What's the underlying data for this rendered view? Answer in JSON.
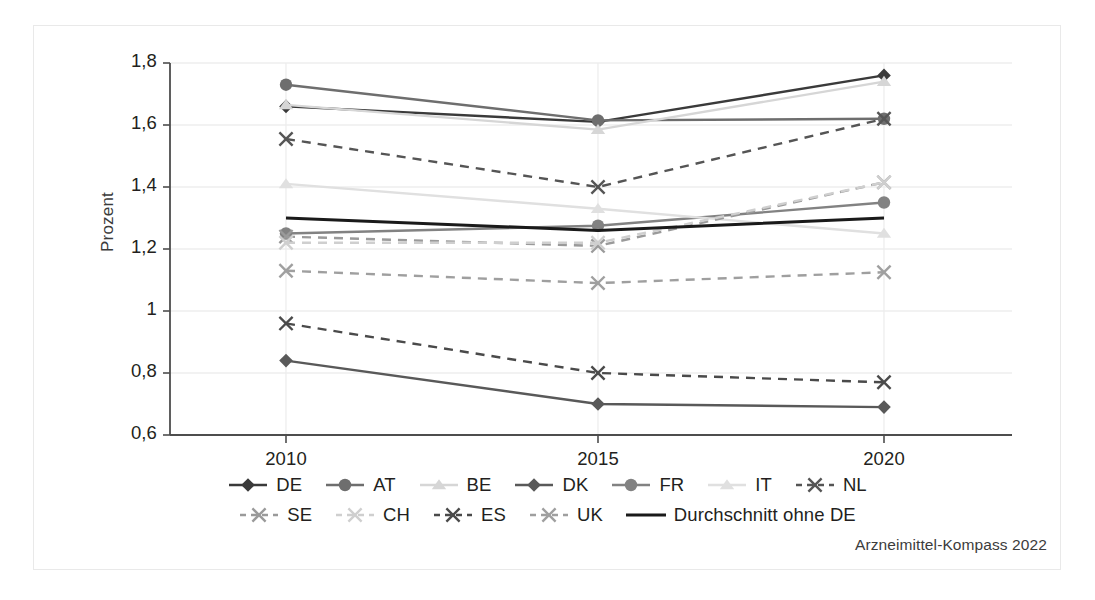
{
  "figure": {
    "source_note": "Arzneimittel-Kompass 2022"
  },
  "chart_data": {
    "type": "line",
    "title": "",
    "subtitle": "",
    "xlabel": "",
    "ylabel": "Prozent",
    "x": [
      2010,
      2015,
      2020
    ],
    "categories": [
      "2010",
      "2015",
      "2020"
    ],
    "xtick_labels": [
      "2010",
      "2015",
      "2020"
    ],
    "ytick_labels": [
      "0,6",
      "0,8",
      "1",
      "1,2",
      "1,4",
      "1,6",
      "1,8"
    ],
    "ytick_values": [
      0.6,
      0.8,
      1.0,
      1.2,
      1.4,
      1.6,
      1.8
    ],
    "ylim": [
      0.6,
      1.8
    ],
    "xlim": [
      2008.2,
      2021.8
    ],
    "grid": "horizontal-and-vertical-light",
    "legend_position": "bottom",
    "series": [
      {
        "name": "DE",
        "values": [
          1.66,
          1.61,
          1.76
        ],
        "color": "#3a3a3a",
        "style": "solid",
        "marker": "diamond"
      },
      {
        "name": "AT",
        "values": [
          1.73,
          1.615,
          1.62
        ],
        "color": "#6e6e6e",
        "style": "solid",
        "marker": "circle"
      },
      {
        "name": "BE",
        "values": [
          1.665,
          1.585,
          1.74
        ],
        "color": "#d6d6d6",
        "style": "solid",
        "marker": "triangle"
      },
      {
        "name": "DK",
        "values": [
          0.84,
          0.7,
          0.69
        ],
        "color": "#595959",
        "style": "solid",
        "marker": "diamond"
      },
      {
        "name": "FR",
        "values": [
          1.25,
          1.275,
          1.35
        ],
        "color": "#828282",
        "style": "solid",
        "marker": "circle"
      },
      {
        "name": "IT",
        "values": [
          1.41,
          1.33,
          1.25
        ],
        "color": "#e0e0e0",
        "style": "solid",
        "marker": "triangle"
      },
      {
        "name": "NL",
        "values": [
          1.555,
          1.4,
          1.62
        ],
        "color": "#555555",
        "style": "dashed",
        "marker": "x"
      },
      {
        "name": "SE",
        "values": [
          1.24,
          1.21,
          1.415
        ],
        "color": "#9a9a9a",
        "style": "dashed",
        "marker": "x"
      },
      {
        "name": "CH",
        "values": [
          1.13,
          1.09,
          1.125
        ],
        "color": "#9f9f9f",
        "style": "dashed",
        "marker": "x"
      },
      {
        "name": "ES",
        "values": [
          0.96,
          0.8,
          0.77
        ],
        "color": "#4a4a4a",
        "style": "dashed",
        "marker": "x"
      },
      {
        "name": "UK",
        "values": [
          1.22,
          1.22,
          1.415
        ],
        "color": "#cfcfcf",
        "style": "dashed",
        "marker": "x"
      },
      {
        "name": "Durchschnitt ohne DE",
        "values": [
          1.3,
          1.26,
          1.3
        ],
        "color": "#1a1a1a",
        "style": "solid",
        "marker": "none"
      }
    ],
    "legend": [
      {
        "label": "DE",
        "color": "#3a3a3a",
        "style": "solid",
        "marker": "diamond"
      },
      {
        "label": "AT",
        "color": "#6e6e6e",
        "style": "solid",
        "marker": "circle"
      },
      {
        "label": "BE",
        "color": "#d6d6d6",
        "style": "solid",
        "marker": "triangle"
      },
      {
        "label": "DK",
        "color": "#595959",
        "style": "solid",
        "marker": "diamond"
      },
      {
        "label": "FR",
        "color": "#828282",
        "style": "solid",
        "marker": "circle"
      },
      {
        "label": "IT",
        "color": "#e0e0e0",
        "style": "solid",
        "marker": "triangle"
      },
      {
        "label": "NL",
        "color": "#555555",
        "style": "dashed",
        "marker": "x"
      },
      {
        "label": "SE",
        "color": "#9a9a9a",
        "style": "dashed",
        "marker": "x"
      },
      {
        "label": "CH",
        "color": "#cfcfcf",
        "style": "dashed",
        "marker": "x"
      },
      {
        "label": "ES",
        "color": "#4a4a4a",
        "style": "dashed",
        "marker": "x"
      },
      {
        "label": "UK",
        "color": "#9f9f9f",
        "style": "dashed",
        "marker": "x"
      },
      {
        "label": "Durchschnitt ohne DE",
        "color": "#1a1a1a",
        "style": "solid",
        "marker": "none"
      }
    ],
    "legend_rows": [
      [
        "DE",
        "AT",
        "BE",
        "DK",
        "FR",
        "IT",
        "NL"
      ],
      [
        "SE",
        "CH",
        "ES",
        "UK",
        "Durchschnitt ohne DE"
      ]
    ]
  }
}
